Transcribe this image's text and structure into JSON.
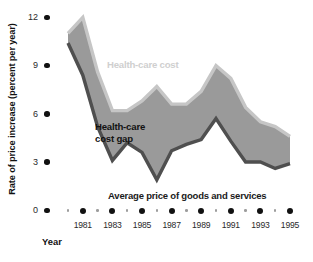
{
  "chart_data": {
    "type": "area",
    "title": "",
    "subtitle": "",
    "xlabel": "Year",
    "ylabel": "Rate of price increase (percent per year)",
    "xlim": [
      1980,
      1995
    ],
    "ylim": [
      0,
      12
    ],
    "grid": false,
    "legend_position": "inline-annotations",
    "y_ticks": [
      0,
      3,
      6,
      9,
      12
    ],
    "y_tick_labels": [
      "0",
      "3",
      "6",
      "9",
      "12"
    ],
    "x_ticks_major": [
      1981,
      1983,
      1985,
      1987,
      1989,
      1991,
      1993,
      1995
    ],
    "x_tick_labels": [
      "1981",
      "1983",
      "1985",
      "1987",
      "1989",
      "1991",
      "1993",
      "1995"
    ],
    "x_ticks_minor": [
      1980,
      1982,
      1984,
      1986,
      1988,
      1990,
      1992,
      1994
    ],
    "x": [
      1980,
      1981,
      1982,
      1983,
      1984,
      1985,
      1986,
      1987,
      1988,
      1989,
      1990,
      1991,
      1992,
      1993,
      1994,
      1995
    ],
    "series": [
      {
        "name": "Health-care cost",
        "values": [
          11.0,
          12.0,
          8.6,
          6.2,
          6.2,
          6.8,
          7.7,
          6.6,
          6.6,
          7.4,
          9.0,
          8.2,
          6.4,
          5.5,
          5.2,
          4.6
        ]
      },
      {
        "name": "Average price of goods and services",
        "values": [
          10.4,
          8.4,
          5.2,
          3.1,
          4.2,
          3.6,
          1.9,
          3.7,
          4.1,
          4.4,
          5.7,
          4.3,
          3.0,
          3.0,
          2.6,
          2.9
        ]
      }
    ],
    "band_label": "Health-care cost gap",
    "annotations": [
      {
        "text": "Health-care cost",
        "x": 1984.4,
        "y": 9.3,
        "color": "#cfcfcf"
      },
      {
        "text": "Health-care",
        "x": 1982.6,
        "y": 5.7,
        "color": "#121212"
      },
      {
        "text": "cost gap",
        "x": 1982.6,
        "y": 5.0,
        "color": "#121212"
      },
      {
        "text": "Average price of goods and services",
        "x": 1984.6,
        "y": 1.2,
        "color": "#1a1a1a"
      }
    ],
    "colors": {
      "band_fill": "#9a9a9a",
      "upper_edge": "#c6c6c6",
      "lower_edge": "#4f4f4f",
      "tick_dot": "#111111",
      "minor_tick_dot": "#9d9d9d",
      "background": "#ffffff"
    }
  },
  "axis": {
    "y_title": "Rate of price increase (percent per year)",
    "x_title": "Year"
  }
}
